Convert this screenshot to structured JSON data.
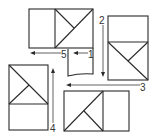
{
  "diagram": {
    "type": "folding-sequence",
    "colors": {
      "line": "#2a2a2a",
      "background": "#ffffff"
    },
    "steps": [
      {
        "label": "1",
        "direction": "left"
      },
      {
        "label": "2",
        "direction": "down"
      },
      {
        "label": "3",
        "direction": "left"
      },
      {
        "label": "4",
        "direction": "up"
      },
      {
        "label": "5",
        "direction": "left"
      }
    ],
    "panels": [
      {
        "name": "top-panel",
        "orientation": "horizontal",
        "diagonal_half": "right"
      },
      {
        "name": "right-panel",
        "orientation": "vertical",
        "diagonal_half": "bottom"
      },
      {
        "name": "bottom-panel",
        "orientation": "horizontal",
        "diagonal_half": "left"
      },
      {
        "name": "left-panel",
        "orientation": "vertical",
        "diagonal_half": "top"
      },
      {
        "name": "small-flap",
        "orientation": "vertical",
        "diagonal_half": "none"
      }
    ]
  }
}
